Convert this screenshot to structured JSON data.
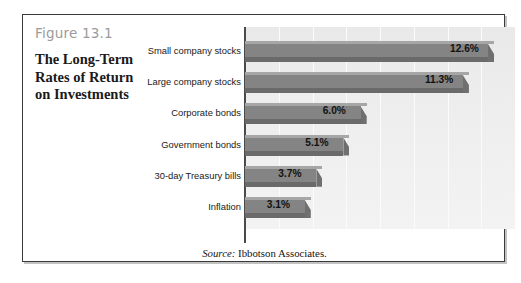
{
  "figure": {
    "number": "Figure 13.1",
    "title_lines": [
      "The Long-Term",
      "Rates of Return",
      "on Investments"
    ],
    "source_lead": "Source:",
    "source_text": "Ibbotson Associates."
  },
  "colors": {
    "frame": "#3a3a3a",
    "figure_number": "#9b9b9b",
    "bar_fill": "#848484",
    "bar_top": "#a6a6a6",
    "bar_shadow": "#6a6a6a",
    "plot_background": "#eeeeee",
    "gridline": "#fbfbfb",
    "axis": "#4a4a4a"
  },
  "chart_data": {
    "type": "bar",
    "orientation": "horizontal",
    "title": "The Long-Term Rates of Return on Investments",
    "categories": [
      "Small company stocks",
      "Large company stocks",
      "Corporate bonds",
      "Government bonds",
      "30-day Treasury bills",
      "Inflation"
    ],
    "values": [
      12.6,
      11.3,
      6.0,
      5.1,
      3.7,
      3.1
    ],
    "data_labels": [
      "12.6%",
      "11.3%",
      "6.0%",
      "5.1%",
      "3.7%",
      "3.1%"
    ],
    "xlabel": "",
    "ylabel": "",
    "xlim": [
      0,
      14
    ],
    "gridlines": {
      "axis": "x",
      "count": 7,
      "step": 2
    },
    "tick_labels": [],
    "legend": null,
    "source": "Source: Ibbotson Associates."
  }
}
